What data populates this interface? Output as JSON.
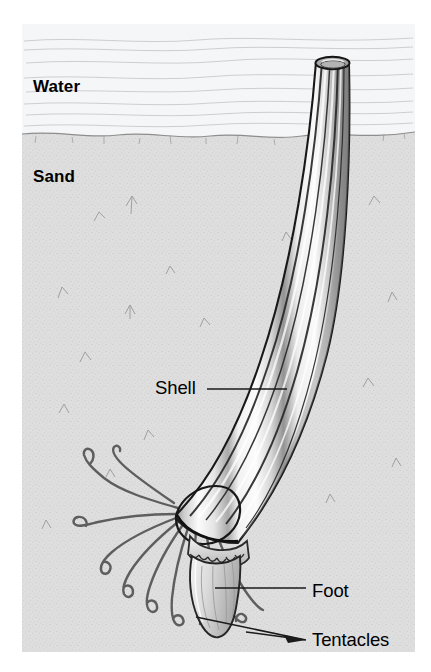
{
  "figure": {
    "width": 431,
    "height": 672,
    "background_color": "#ffffff"
  },
  "environment_labels": [
    {
      "id": "water",
      "text": "Water",
      "x": 33,
      "y": 78,
      "bold": true
    },
    {
      "id": "sand",
      "text": "Sand",
      "x": 33,
      "y": 168,
      "bold": true
    }
  ],
  "part_labels": [
    {
      "id": "shell",
      "text": "Shell",
      "x": 155,
      "y": 379,
      "leader": true
    },
    {
      "id": "foot",
      "text": "Foot",
      "x": 312,
      "y": 582,
      "leader": true
    },
    {
      "id": "tentacles",
      "text": "Tentacles",
      "x": 312,
      "y": 631,
      "leader": true
    }
  ],
  "labels": {
    "water": "Water",
    "sand": "Sand",
    "shell": "Shell",
    "foot": "Foot",
    "tentacles": "Tentacles"
  },
  "colors": {
    "ink": "#000000",
    "water_fill": "#f4f5f6",
    "sand_fill": "#dcdcdc",
    "sand_line": "#7a7a7a",
    "shell_light": "#fdfdfd",
    "shell_mid": "#d6d6d6",
    "shell_dark": "#8f8f8f",
    "shell_outline": "#171717",
    "leader_line": "#1a1a1a",
    "foot_fill": "#d0d0d0",
    "tentacle_stroke": "#5a5a5a"
  },
  "scene": {
    "sand_surface_y": 134,
    "illustration_bounds": {
      "left": 22,
      "top": 24,
      "right": 415,
      "bottom": 652
    },
    "shell_tip_top_y": 58,
    "shell_aperture_y": 520
  }
}
